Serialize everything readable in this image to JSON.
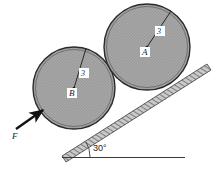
{
  "figure": {
    "background_color": "#ffffff",
    "stroke_color": "#1a1a1a",
    "body_fill_color": "#a8a8a8",
    "incline_fill_color": "#b5b5b5"
  },
  "bodies": [
    {
      "id": "A",
      "label": "A",
      "radius_label": "3",
      "center": {
        "x": 147,
        "y": 47
      },
      "radius_px": 43,
      "label_pos": {
        "x": 145,
        "y": 52
      },
      "radius_label_pos": {
        "x": 159,
        "y": 33
      },
      "radius_line_end": {
        "x": 172,
        "y": 11
      }
    },
    {
      "id": "B",
      "label": "B",
      "radius_label": "3",
      "center": {
        "x": 74,
        "y": 88
      },
      "radius_px": 41,
      "label_pos": {
        "x": 72,
        "y": 95
      },
      "radius_label_pos": {
        "x": 84,
        "y": 75
      },
      "radius_line_end": {
        "x": 86,
        "y": 51
      }
    }
  ],
  "force": {
    "label": "F",
    "label_pos": {
      "x": 14,
      "y": 136
    },
    "tail": {
      "x": 17,
      "y": 128
    },
    "head": {
      "x": 43,
      "y": 110
    }
  },
  "incline": {
    "angle_label": "30°",
    "angle_label_pos": {
      "x": 93,
      "y": 150
    },
    "apex": {
      "x": 62,
      "y": 156
    },
    "top_end": {
      "x": 207,
      "y": 64
    },
    "baseline_start": {
      "x": 62,
      "y": 156
    },
    "baseline_end": {
      "x": 185,
      "y": 156
    },
    "hatch_band_width": 7
  }
}
